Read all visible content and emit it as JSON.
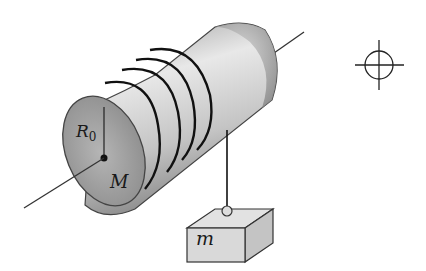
{
  "diagram": {
    "type": "physics-illustration",
    "labels": {
      "radius": "R",
      "radius_subscript": "0",
      "cylinder_mass": "M",
      "block_mass": "m"
    },
    "elements": {
      "cylinder": {
        "label": "M",
        "radius_label": "R0"
      },
      "axle": {
        "shown": true
      },
      "rope_windings": 4,
      "hanging_block": {
        "label": "m"
      },
      "crosshair_symbol": {
        "shown": true
      }
    },
    "colors": {
      "outline": "#333333",
      "cylinder_light": "#e6e6e6",
      "cylinder_dark": "#8c8c8c",
      "block_fill": "#d9d9d9",
      "background": "#ffffff"
    }
  }
}
